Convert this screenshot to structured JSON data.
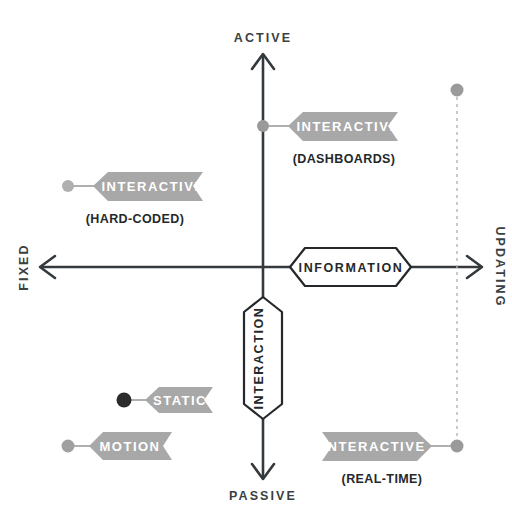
{
  "diagram": {
    "type": "quadrant-diagram",
    "title": "",
    "background_color": "#ffffff",
    "axis_color": "#33393d",
    "flag_color": "#a8a8a8",
    "flag_text_color": "#ffffff",
    "dot_color": "#8f8f8f",
    "dot_color_dark": "#2b2b2b",
    "dashed_line_color": "#b4b4b4",
    "axes": {
      "vertical": {
        "top_label": "ACTIVE",
        "bottom_label": "PASSIVE",
        "badge_label": "INTERACTION",
        "badge_orientation": "vertical"
      },
      "horizontal": {
        "left_label": "FIXED",
        "right_label": "UPDATING",
        "badge_label": "INFORMATION",
        "badge_orientation": "horizontal"
      }
    },
    "markers": [
      {
        "id": "interactive-dashboards",
        "label": "INTERACTIVE",
        "sublabel": "(DASHBOARDS)",
        "quadrant": "active-fixed-center",
        "flag_direction": "left",
        "dot_tone": "light",
        "x": 263,
        "y": 126
      },
      {
        "id": "interactive-hard-coded",
        "label": "INTERACTIVE",
        "sublabel": "(HARD-CODED)",
        "quadrant": "active-fixed",
        "flag_direction": "left",
        "dot_tone": "light",
        "x": 68,
        "y": 186
      },
      {
        "id": "static",
        "label": "STATIC",
        "sublabel": "",
        "quadrant": "passive-fixed",
        "flag_direction": "left",
        "dot_tone": "dark",
        "x": 124,
        "y": 400
      },
      {
        "id": "motion",
        "label": "MOTION",
        "sublabel": "",
        "quadrant": "passive-fixed",
        "flag_direction": "left",
        "dot_tone": "light",
        "x": 68,
        "y": 446
      },
      {
        "id": "interactive-real-time",
        "label": "INTERACTIVE",
        "sublabel": "(REAL-TIME)",
        "quadrant": "passive-updating",
        "flag_direction": "right",
        "dot_tone": "light",
        "x": 457,
        "y": 446
      },
      {
        "id": "updating-anchor",
        "label": "",
        "sublabel": "",
        "quadrant": "active-updating",
        "flag_direction": "none",
        "dot_tone": "light",
        "x": 457,
        "y": 90
      }
    ],
    "connectors": [
      {
        "id": "updating-dashed-connector",
        "style": "dashed",
        "from": "updating-anchor",
        "to": "interactive-real-time"
      }
    ]
  }
}
